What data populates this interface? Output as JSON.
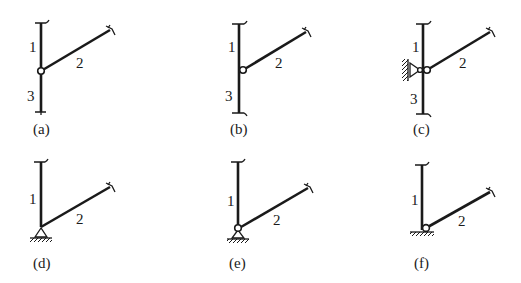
{
  "figure": {
    "panels": [
      {
        "id": "a",
        "caption": "(a)",
        "members": [
          "1",
          "2",
          "3"
        ],
        "joint": "hinge"
      },
      {
        "id": "b",
        "caption": "(b)",
        "members": [
          "1",
          "2",
          "3"
        ],
        "joint": "hinge-offset"
      },
      {
        "id": "c",
        "caption": "(c)",
        "members": [
          "1",
          "2",
          "3"
        ],
        "joint": "hinge-with-lateral-pin-support"
      },
      {
        "id": "d",
        "caption": "(d)",
        "members": [
          "1",
          "2"
        ],
        "joint": "rigid-on-pin-support"
      },
      {
        "id": "e",
        "caption": "(e)",
        "members": [
          "1",
          "2"
        ],
        "joint": "hinge-on-pin-support"
      },
      {
        "id": "f",
        "caption": "(f)",
        "members": [
          "1",
          "2"
        ],
        "joint": "hinge-on-ground"
      }
    ],
    "colors": {
      "line": "#1a1a1a",
      "background": "#ffffff"
    }
  }
}
